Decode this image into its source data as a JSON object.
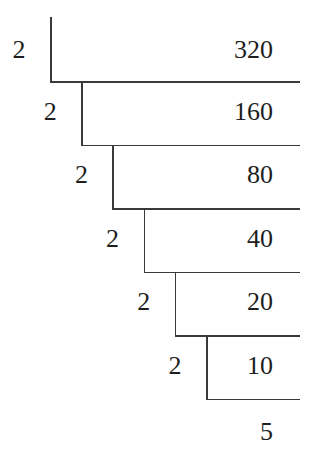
{
  "diagram": {
    "steps": [
      {
        "divisor": "2",
        "dividend": "320"
      },
      {
        "divisor": "2",
        "dividend": "160"
      },
      {
        "divisor": "2",
        "dividend": "80"
      },
      {
        "divisor": "2",
        "dividend": "40"
      },
      {
        "divisor": "2",
        "dividend": "20"
      },
      {
        "divisor": "2",
        "dividend": "10"
      }
    ],
    "quotient": "5",
    "line_color": "#3a3a3a",
    "text_color": "#1e1e1e"
  }
}
